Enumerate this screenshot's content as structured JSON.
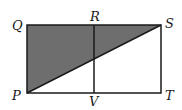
{
  "diagram": {
    "type": "geometry-figure",
    "colors": {
      "stroke": "#1a1a1a",
      "shade": "#6e6e6e",
      "background": "#ffffff"
    },
    "points": {
      "Q": {
        "label": "Q",
        "x": 27,
        "y": 25
      },
      "R": {
        "label": "R",
        "x": 94,
        "y": 25
      },
      "S": {
        "label": "S",
        "x": 161,
        "y": 25
      },
      "P": {
        "label": "P",
        "x": 27,
        "y": 93
      },
      "V": {
        "label": "V",
        "x": 94,
        "y": 93
      },
      "T": {
        "label": "T",
        "x": 161,
        "y": 93
      }
    },
    "segments": [
      {
        "from": "Q",
        "to": "S"
      },
      {
        "from": "S",
        "to": "T"
      },
      {
        "from": "T",
        "to": "P"
      },
      {
        "from": "P",
        "to": "Q"
      },
      {
        "from": "R",
        "to": "V"
      },
      {
        "from": "P",
        "to": "S"
      }
    ],
    "shaded_region": [
      "P",
      "Q",
      "S"
    ],
    "labels": {
      "Q": "Q",
      "R": "R",
      "S": "S",
      "P": "P",
      "V": "V",
      "T": "T"
    }
  }
}
